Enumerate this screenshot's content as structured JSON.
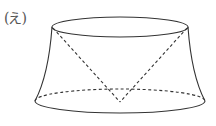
{
  "figure": {
    "label": "(え)",
    "stroke_color": "#333333",
    "top_ellipse": {
      "cx": 120,
      "cy": 27,
      "rx": 68,
      "ry": 10
    },
    "bottom_ellipse": {
      "cx": 120,
      "cy": 101,
      "rx": 85,
      "ry": 12
    },
    "cone_apex": {
      "x": 120,
      "y": 102
    }
  }
}
